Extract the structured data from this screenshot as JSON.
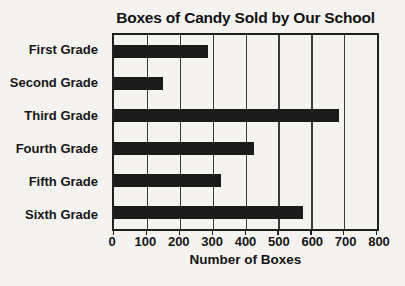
{
  "title": "Boxes of Candy Sold by Our School",
  "chart_data": {
    "type": "bar",
    "orientation": "horizontal",
    "title": "Boxes of Candy Sold by Our School",
    "categories": [
      "First Grade",
      "Second Grade",
      "Third Grade",
      "Fourth Grade",
      "Fifth Grade",
      "Sixth Grade"
    ],
    "values": [
      285,
      150,
      685,
      425,
      325,
      575
    ],
    "xlabel": "Number of Boxes",
    "ylabel": "",
    "xlim": [
      0,
      800
    ],
    "x_ticks": [
      0,
      100,
      200,
      300,
      400,
      500,
      600,
      700,
      800
    ],
    "grid": "vertical-only",
    "legend": "none",
    "bar_color": "#1b1b1b"
  },
  "colors": {
    "background": "#f4f3f0",
    "bar": "#1b1b1b",
    "grid": "#3c3c3c",
    "border": "#1f1f1f",
    "text": "#141414"
  }
}
